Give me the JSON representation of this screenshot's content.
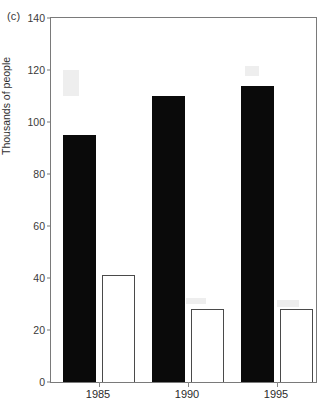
{
  "figure": {
    "panel_label": "(c)",
    "ylabel": "Thousands of people"
  },
  "chart_data": {
    "type": "bar",
    "title": "",
    "subtitle": "",
    "xlabel": "",
    "ylabel": "Thousands of people",
    "panel": "(c)",
    "categories": [
      "1985",
      "1990",
      "1995"
    ],
    "series": [
      {
        "name": "filled",
        "fill": "#0a0a0a",
        "values": [
          95,
          110,
          114
        ]
      },
      {
        "name": "open",
        "fill": "#ffffff",
        "values": [
          41,
          28,
          28
        ]
      }
    ],
    "ylim": [
      0,
      140
    ],
    "yticks": [
      0,
      20,
      40,
      60,
      80,
      100,
      120,
      140
    ],
    "ytick_labels": [
      "0",
      "20",
      "40",
      "60",
      "80",
      "100",
      "120",
      "140"
    ],
    "grid": false,
    "legend": "none",
    "axis_frame": "box"
  }
}
